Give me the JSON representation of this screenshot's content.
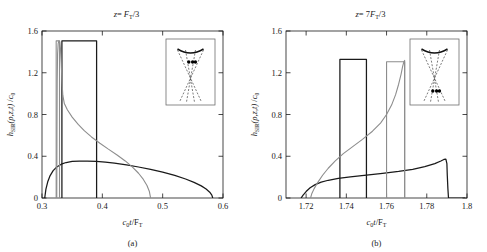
{
  "figure": {
    "caption_a": "(a)",
    "caption_b": "(b)"
  },
  "colors": {
    "curve_primary": "#1a1a1a",
    "curve_secondary": "#8d8d8d",
    "axis": "#1a1a1a",
    "inset_frame": "#6e6e6e",
    "background": "#ffffff"
  },
  "chart_data": [
    {
      "type": "line",
      "panel": "a",
      "title": "z = F_T/3",
      "title_plain": "z= Fᴛ/3",
      "xlabel": "c₀t/Fᴛ",
      "ylabel": "hₛᵢᵣ(ρ,z,t) /c₀",
      "ylabel_plain": "hSIR(p,z,t) /c0",
      "xlim": [
        0.3,
        0.6
      ],
      "ylim": [
        0.0,
        1.6
      ],
      "xticks": [
        0.3,
        0.4,
        0.5,
        0.6
      ],
      "xticklabels": [
        "0.3",
        "0.4",
        "0.5",
        "0.6"
      ],
      "yticks": [
        0.0,
        0.4,
        0.8,
        1.2,
        1.6
      ],
      "yticklabels": [
        "0",
        "0.4",
        "0.8",
        "1.2",
        "1.6"
      ],
      "grid": false,
      "legend": "none",
      "series": [
        {
          "name": "exact-sir-black",
          "color": "#1a1a1a",
          "points": [
            [
              0.3045,
              0.0
            ],
            [
              0.3065,
              0.085
            ],
            [
              0.3095,
              0.155
            ],
            [
              0.3135,
              0.215
            ],
            [
              0.3185,
              0.262
            ],
            [
              0.3245,
              0.297
            ],
            [
              0.332,
              0.324
            ],
            [
              0.34,
              0.34
            ],
            [
              0.35,
              0.35
            ],
            [
              0.362,
              0.354
            ],
            [
              0.375,
              0.354
            ],
            [
              0.39,
              0.35
            ],
            [
              0.405,
              0.343
            ],
            [
              0.42,
              0.333
            ],
            [
              0.44,
              0.317
            ],
            [
              0.46,
              0.297
            ],
            [
              0.48,
              0.274
            ],
            [
              0.5,
              0.248
            ],
            [
              0.52,
              0.216
            ],
            [
              0.538,
              0.182
            ],
            [
              0.552,
              0.15
            ],
            [
              0.564,
              0.116
            ],
            [
              0.572,
              0.086
            ],
            [
              0.578,
              0.056
            ],
            [
              0.5815,
              0.028
            ],
            [
              0.583,
              0.0
            ]
          ]
        },
        {
          "name": "rect-approx-black",
          "color": "#1a1a1a",
          "points": [
            [
              0.333,
              0.0
            ],
            [
              0.333,
              1.505
            ],
            [
              0.3905,
              1.505
            ],
            [
              0.3905,
              0.0
            ]
          ]
        },
        {
          "name": "exact-sir-gray",
          "color": "#8d8d8d",
          "points": [
            [
              0.3245,
              0.0
            ],
            [
              0.3248,
              0.6
            ],
            [
              0.3252,
              1.12
            ],
            [
              0.3258,
              1.38
            ],
            [
              0.3268,
              1.48
            ],
            [
              0.328,
              1.505
            ],
            [
              0.3295,
              1.495
            ],
            [
              0.3305,
              1.44
            ],
            [
              0.3318,
              1.3
            ],
            [
              0.333,
              1.13
            ],
            [
              0.3345,
              0.985
            ],
            [
              0.337,
              0.905
            ],
            [
              0.342,
              0.845
            ],
            [
              0.35,
              0.775
            ],
            [
              0.36,
              0.705
            ],
            [
              0.37,
              0.645
            ],
            [
              0.382,
              0.585
            ],
            [
              0.396,
              0.525
            ],
            [
              0.41,
              0.468
            ],
            [
              0.425,
              0.41
            ],
            [
              0.438,
              0.355
            ],
            [
              0.45,
              0.296
            ],
            [
              0.46,
              0.237
            ],
            [
              0.468,
              0.178
            ],
            [
              0.474,
              0.12
            ],
            [
              0.478,
              0.062
            ],
            [
              0.48,
              0.0
            ]
          ]
        },
        {
          "name": "rect-approx-gray",
          "color": "#8d8d8d",
          "points": [
            [
              0.3235,
              0.0
            ],
            [
              0.3235,
              1.505
            ],
            [
              0.329,
              1.505
            ],
            [
              0.329,
              0.0
            ]
          ]
        }
      ],
      "inset": {
        "name": "transducer-geometry-near-focus",
        "dots": 3,
        "dot_position": "at-focus",
        "description": "curved transducer aperture with dashed converging rays and field points near focal crossing"
      }
    },
    {
      "type": "line",
      "panel": "b",
      "title": "z = 7F_T/3",
      "title_plain": "z= 7Fᴛ/3",
      "xlabel": "c₀t/Fᴛ",
      "ylabel": "hₛᵢᵣ(ρ,z,t) /c₀",
      "ylabel_plain": "hSIR(p,z,t) /c0",
      "xlim": [
        1.71,
        1.8
      ],
      "ylim": [
        0.0,
        1.6
      ],
      "xticks": [
        1.72,
        1.74,
        1.76,
        1.78,
        1.8
      ],
      "xticklabels": [
        "1.72",
        "1.74",
        "1.76",
        "1.78",
        "1.8"
      ],
      "yticks": [
        0.0,
        0.4,
        0.8,
        1.2,
        1.6
      ],
      "yticklabels": [
        "0",
        "0.4",
        "0.8",
        "1.2",
        "1.6"
      ],
      "grid": false,
      "legend": "none",
      "series": [
        {
          "name": "exact-sir-black",
          "color": "#1a1a1a",
          "points": [
            [
              1.7175,
              0.0
            ],
            [
              1.7185,
              0.028
            ],
            [
              1.72,
              0.062
            ],
            [
              1.722,
              0.098
            ],
            [
              1.7245,
              0.128
            ],
            [
              1.7275,
              0.152
            ],
            [
              1.731,
              0.17
            ],
            [
              1.736,
              0.187
            ],
            [
              1.742,
              0.202
            ],
            [
              1.75,
              0.219
            ],
            [
              1.758,
              0.236
            ],
            [
              1.766,
              0.254
            ],
            [
              1.773,
              0.275
            ],
            [
              1.779,
              0.3
            ],
            [
              1.784,
              0.33
            ],
            [
              1.787,
              0.355
            ],
            [
              1.7885,
              0.369
            ],
            [
              1.7895,
              0.372
            ],
            [
              1.79,
              0.33
            ],
            [
              1.7902,
              0.215
            ],
            [
              1.7905,
              0.09
            ],
            [
              1.7908,
              0.0
            ],
            [
              1.799,
              0.0
            ]
          ]
        },
        {
          "name": "rect-approx-black",
          "color": "#1a1a1a",
          "points": [
            [
              1.7368,
              0.0
            ],
            [
              1.7368,
              1.328
            ],
            [
              1.75,
              1.328
            ],
            [
              1.75,
              0.0
            ]
          ]
        },
        {
          "name": "exact-sir-gray",
          "color": "#8d8d8d",
          "points": [
            [
              1.7222,
              0.0
            ],
            [
              1.7228,
              0.04
            ],
            [
              1.724,
              0.09
            ],
            [
              1.7258,
              0.15
            ],
            [
              1.7282,
              0.218
            ],
            [
              1.731,
              0.285
            ],
            [
              1.7345,
              0.355
            ],
            [
              1.7385,
              0.425
            ],
            [
              1.743,
              0.49
            ],
            [
              1.748,
              0.562
            ],
            [
              1.753,
              0.64
            ],
            [
              1.757,
              0.718
            ],
            [
              1.76,
              0.8
            ],
            [
              1.7625,
              0.89
            ],
            [
              1.7645,
              0.99
            ],
            [
              1.766,
              1.09
            ],
            [
              1.7672,
              1.185
            ],
            [
              1.768,
              1.262
            ],
            [
              1.7686,
              1.305
            ],
            [
              1.769,
              1.318
            ],
            [
              1.769,
              0.0
            ]
          ]
        },
        {
          "name": "rect-approx-gray",
          "color": "#8d8d8d",
          "points": [
            [
              1.76,
              0.0
            ],
            [
              1.76,
              1.305
            ],
            [
              1.769,
              1.305
            ],
            [
              1.769,
              0.0
            ]
          ]
        }
      ],
      "inset": {
        "name": "transducer-geometry-far-field",
        "dots": 3,
        "dot_position": "beyond-focus",
        "description": "curved transducer aperture with dashed diverging rays and field points past the focal crossing"
      }
    }
  ]
}
